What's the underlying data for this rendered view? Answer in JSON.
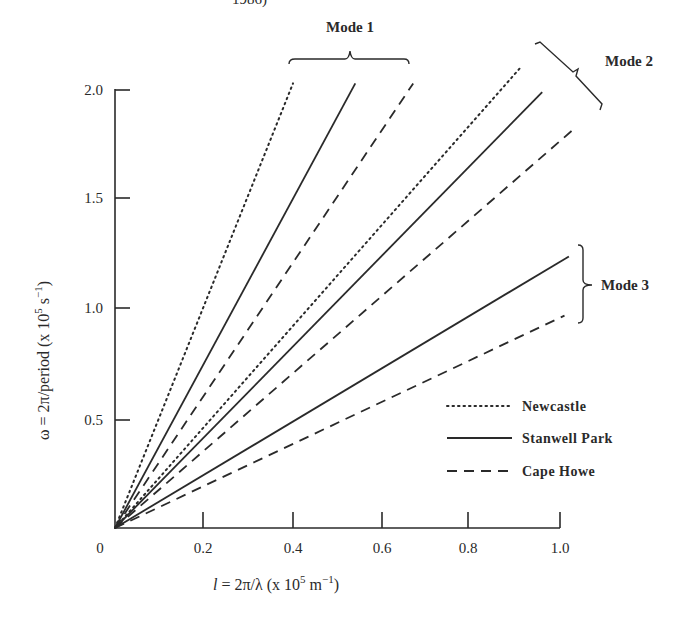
{
  "header": {
    "clipped_text": "1986)"
  },
  "chart_data": {
    "type": "line",
    "title": "",
    "xlabel": "l = 2π/λ (x 10^5 m^-1)",
    "ylabel": "ω = 2π/period (x 10^5 s^-1)",
    "xlim": [
      0,
      1.0
    ],
    "ylim": [
      0,
      2.0
    ],
    "x_ticks": [
      "0",
      "0.2",
      "0.4",
      "0.6",
      "0.8",
      "1.0"
    ],
    "y_ticks": [
      "0.5",
      "1.0",
      "1.5",
      "2.0"
    ],
    "grid": false,
    "legend_position": "lower right",
    "legend": [
      {
        "name": "Newcastle",
        "style": "dotted"
      },
      {
        "name": "Stanwell Park",
        "style": "solid"
      },
      {
        "name": "Cape Howe",
        "style": "dashed"
      }
    ],
    "annotations": [
      "Mode 1",
      "Mode 2",
      "Mode 3"
    ],
    "series": [
      {
        "name": "Newcastle",
        "mode": "Mode 1",
        "style": "dotted",
        "x": [
          0,
          0.4
        ],
        "y": [
          0,
          2.03
        ]
      },
      {
        "name": "Stanwell Park",
        "mode": "Mode 1",
        "style": "solid",
        "x": [
          0,
          0.54
        ],
        "y": [
          0,
          2.03
        ]
      },
      {
        "name": "Cape Howe",
        "mode": "Mode 1",
        "style": "dashed",
        "x": [
          0,
          0.67
        ],
        "y": [
          0,
          2.03
        ]
      },
      {
        "name": "Newcastle",
        "mode": "Mode 2",
        "style": "dotted",
        "x": [
          0,
          0.91
        ],
        "y": [
          0,
          2.1
        ]
      },
      {
        "name": "Stanwell Park",
        "mode": "Mode 2",
        "style": "solid",
        "x": [
          0,
          0.96
        ],
        "y": [
          0,
          1.99
        ]
      },
      {
        "name": "Cape Howe",
        "mode": "Mode 2",
        "style": "dashed",
        "x": [
          0,
          1.03
        ],
        "y": [
          0,
          1.82
        ]
      },
      {
        "name": "Stanwell Park",
        "mode": "Mode 3",
        "style": "solid",
        "x": [
          0,
          1.02
        ],
        "y": [
          0,
          1.24
        ]
      },
      {
        "name": "Cape Howe",
        "mode": "Mode 3",
        "style": "dashed",
        "x": [
          0,
          1.01
        ],
        "y": [
          0,
          0.97
        ]
      }
    ]
  },
  "labels": {
    "mode1": "Mode 1",
    "mode2": "Mode 2",
    "mode3": "Mode 3",
    "xlabel_main": "l",
    "xlabel_rest": " = 2π/λ (x 10",
    "xlabel_exp": "5",
    "xlabel_unit": " m",
    "xlabel_unit_exp": "−1",
    "xlabel_close": ")",
    "ylabel_main": "ω = 2π/period (x 10",
    "ylabel_exp": "5",
    "ylabel_unit": " s",
    "ylabel_unit_exp": "−1",
    "ylabel_close": ")",
    "legend_newcastle": "Newcastle",
    "legend_stanwell": "Stanwell Park",
    "legend_capehowe": "Cape Howe",
    "xt0": "0",
    "xt1": "0.2",
    "xt2": "0.4",
    "xt3": "0.6",
    "xt4": "0.8",
    "xt5": "1.0",
    "yt1": "0.5",
    "yt2": "1.0",
    "yt3": "1.5",
    "yt4": "2.0"
  },
  "colors": {
    "ink": "#2a2a2a",
    "background": "#ffffff"
  }
}
